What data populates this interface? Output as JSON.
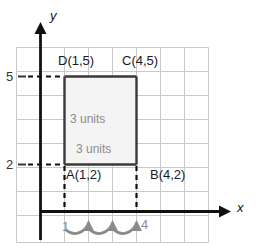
{
  "figure": {
    "axes": {
      "x_label": "x",
      "y_label": "y"
    },
    "tick_labels": {
      "y_5": "5",
      "y_2": "2"
    },
    "points": [
      {
        "name": "D",
        "label": "D(1,5)",
        "x": 1,
        "y": 5
      },
      {
        "name": "C",
        "label": "C(4,5)",
        "x": 4,
        "y": 5
      },
      {
        "name": "A",
        "label": "A(1,2)",
        "x": 1,
        "y": 2
      },
      {
        "name": "B",
        "label": "B(4,2)",
        "x": 4,
        "y": 2
      }
    ],
    "measurements": {
      "vertical": "3 units",
      "horizontal": "3 units"
    },
    "arc_labels": {
      "start": "1",
      "end": "4"
    },
    "colors": {
      "grid": "#c9c9c9",
      "axis": "#111111",
      "shape_stroke": "#3a3a3a",
      "shape_fill": "#f4f4f4",
      "dashed": "#111111",
      "arc": "#8a8a8a",
      "unit_text": "#8c8c8c"
    }
  }
}
